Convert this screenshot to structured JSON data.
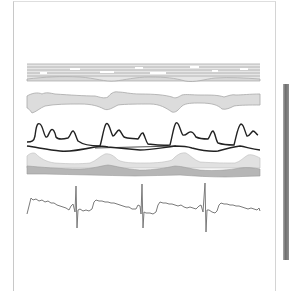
{
  "figure": {
    "colors": {
      "background": "#ffffff",
      "panel_border": "#c8c8c8",
      "band_fill": "#dcdcdc",
      "band_stroke": "#a8a8a8",
      "dark_band": "#b4b4b4",
      "pressure_trace": "#222222",
      "ecg_trace": "#777777"
    },
    "channels": [
      {
        "name": "m-mode-stripes",
        "type": "stacked-lines"
      },
      {
        "name": "flow-band",
        "type": "filled-band"
      },
      {
        "name": "pressure-traces",
        "type": "line",
        "series": [
          "ventricular-pressure",
          "atrial-pressure"
        ]
      },
      {
        "name": "volume-bands",
        "type": "filled-band"
      },
      {
        "name": "ecg",
        "type": "line"
      }
    ],
    "beats": 4
  }
}
